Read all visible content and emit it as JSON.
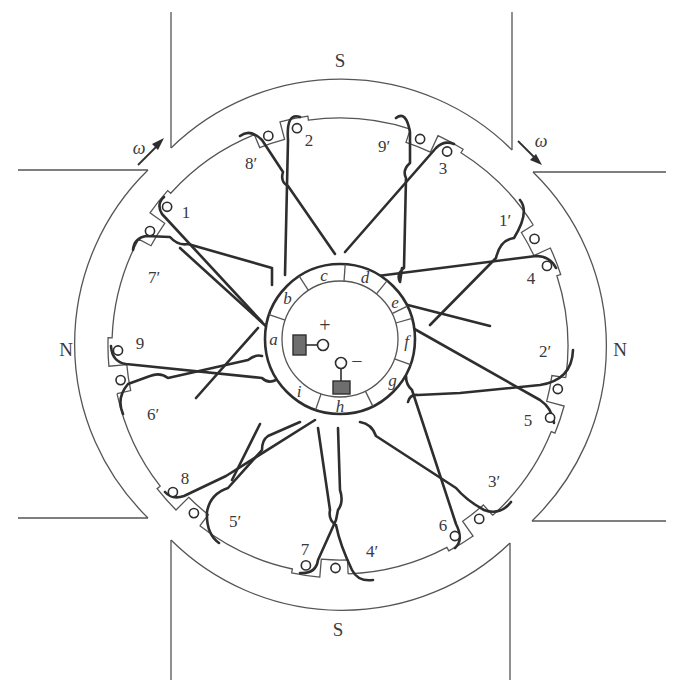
{
  "diagram": {
    "poles": {
      "top": "S",
      "bottom": "S",
      "left": "N",
      "right": "N"
    },
    "rotation": {
      "symbol": "ω",
      "arrows": [
        "top-left (clockwise)",
        "top-right (clockwise)"
      ]
    },
    "slot_labels": [
      "1",
      "1′",
      "2",
      "2′",
      "3",
      "3′",
      "4",
      "4′",
      "5",
      "5′",
      "6",
      "6′",
      "7",
      "7′",
      "8",
      "8′",
      "9",
      "9′"
    ],
    "slots": [
      {
        "pair": "8′ | 2",
        "angle_deg": -105
      },
      {
        "pair": "9′ | 3",
        "angle_deg": -65
      },
      {
        "pair": "1′ | 4",
        "angle_deg": -25
      },
      {
        "pair": "2′ | 5",
        "angle_deg": 15
      },
      {
        "pair": "3′ | 6",
        "angle_deg": 55
      },
      {
        "pair": "4′ | 7",
        "angle_deg": 95
      },
      {
        "pair": "5′ | 8",
        "angle_deg": 135
      },
      {
        "pair": "6′ | 9",
        "angle_deg": 175
      },
      {
        "pair": "7′ | 1",
        "angle_deg": 215
      }
    ],
    "commutator": {
      "segments": [
        "a",
        "b",
        "c",
        "d",
        "e",
        "f",
        "g",
        "h",
        "i"
      ]
    },
    "brushes": {
      "positive": "+",
      "negative": "−"
    }
  }
}
